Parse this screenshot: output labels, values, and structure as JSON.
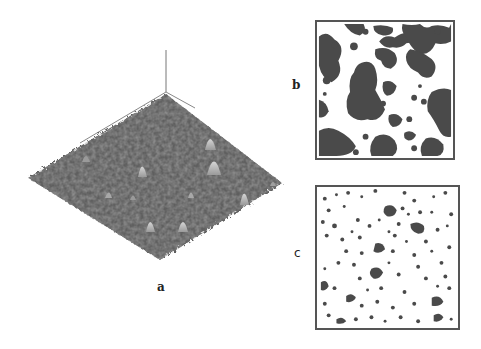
{
  "figure": {
    "panels": [
      {
        "id": "a",
        "label": "a",
        "kind": "3d-surface-topography",
        "description": "3D surface height map rendered as rhombus-shaped terrain with vertical z-axis"
      },
      {
        "id": "b",
        "label": "b",
        "kind": "binary-map",
        "description": "Thresholded binary map with large dark connected regions"
      },
      {
        "id": "c",
        "label": "c",
        "kind": "binary-map",
        "description": "Thresholded binary map with small scattered dark particles"
      }
    ]
  },
  "colors": {
    "surface_dark": "#4a4a4a",
    "surface_mid": "#6b6b6b",
    "surface_peak": "#c8c8c8",
    "map_dark": "#4a4a4a",
    "map_border": "#555555",
    "background": "#ffffff"
  }
}
